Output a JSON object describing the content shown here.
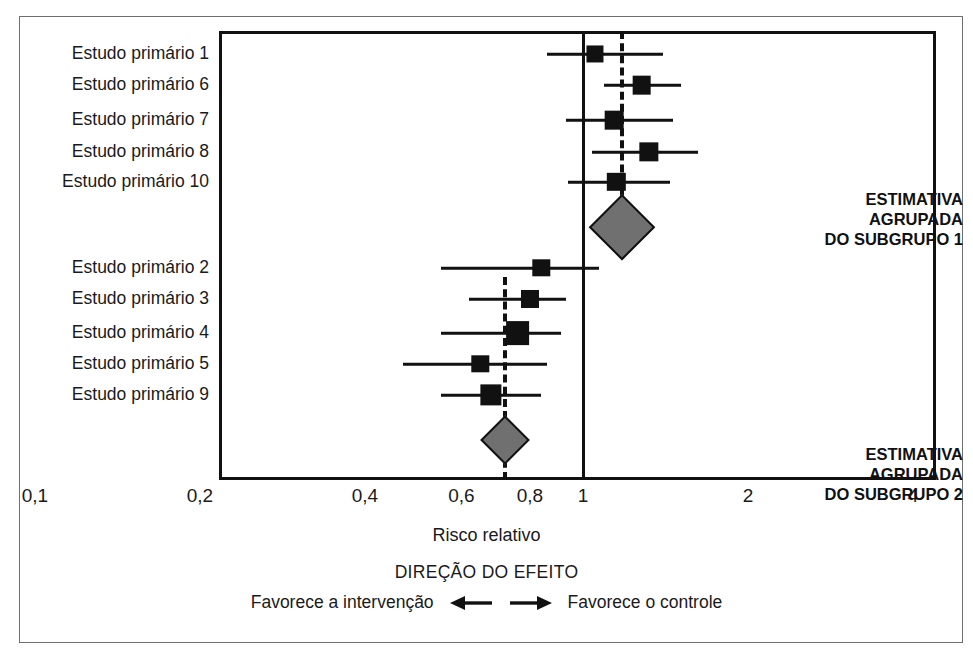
{
  "chart_data": {
    "type": "forest",
    "title": "",
    "xlabel": "Risco relativo",
    "ylabel": "",
    "xscale": "log",
    "xlim": [
      0.085,
      4.6
    ],
    "grid": false,
    "legend": "none",
    "null_line": 1,
    "tick_labels": [
      "0,1",
      "0,2",
      "0,4",
      "0,6",
      "0,8",
      "1",
      "2",
      "4"
    ],
    "tick_values": [
      0.1,
      0.2,
      0.4,
      0.6,
      0.8,
      1,
      2,
      4
    ],
    "subgroups": [
      {
        "name": "ESTIMATIVA AGRUPADA DO SUBGRUPO 1",
        "pooled_label_lines": [
          "ESTIMATIVA",
          "AGRUPADA",
          "DO SUBGRUPO 1"
        ],
        "pooled_estimate": 1.18,
        "pooled_ci_low": 1.03,
        "pooled_ci_high": 1.36,
        "dashed_reference": 1.18,
        "studies": [
          {
            "label": "Estudo primário 1",
            "estimate": 1.05,
            "ci_low": 0.86,
            "ci_high": 1.4,
            "weight": 0.38
          },
          {
            "label": "Estudo primário 6",
            "estimate": 1.28,
            "ci_low": 1.09,
            "ci_high": 1.51,
            "weight": 0.48
          },
          {
            "label": "Estudo primário 7",
            "estimate": 1.14,
            "ci_low": 0.93,
            "ci_high": 1.46,
            "weight": 0.48
          },
          {
            "label": "Estudo primário 8",
            "estimate": 1.32,
            "ci_low": 1.04,
            "ci_high": 1.62,
            "weight": 0.52
          },
          {
            "label": "Estudo primário 10",
            "estimate": 1.15,
            "ci_low": 0.94,
            "ci_high": 1.44,
            "weight": 0.46
          }
        ]
      },
      {
        "name": "ESTIMATIVA AGRUPADA DO SUBGRUPO 2",
        "pooled_label_lines": [
          "ESTIMATIVA",
          "AGRUPADA",
          "DO SUBGRUPO 2"
        ],
        "pooled_estimate": 0.72,
        "pooled_ci_low": 0.65,
        "pooled_ci_high": 0.8,
        "dashed_reference": 0.72,
        "studies": [
          {
            "label": "Estudo primário 2",
            "estimate": 0.84,
            "ci_low": 0.55,
            "ci_high": 1.07,
            "weight": 0.4
          },
          {
            "label": "Estudo primário 3",
            "estimate": 0.8,
            "ci_low": 0.62,
            "ci_high": 0.93,
            "weight": 0.44
          },
          {
            "label": "Estudo primário 4",
            "estimate": 0.76,
            "ci_low": 0.55,
            "ci_high": 0.91,
            "weight": 0.8
          },
          {
            "label": "Estudo primário 5",
            "estimate": 0.65,
            "ci_low": 0.47,
            "ci_high": 0.86,
            "weight": 0.4
          },
          {
            "label": "Estudo primário 9",
            "estimate": 0.68,
            "ci_low": 0.55,
            "ci_high": 0.84,
            "weight": 0.64
          }
        ]
      }
    ],
    "annotations": {
      "direction_title": "DIREÇÃO DO EFEITO",
      "favors_left": "Favorece a intervenção",
      "favors_right": "Favorece o controle"
    }
  },
  "axis": {
    "x_label": "Risco relativo",
    "ticks": [
      "0,1",
      "0,2",
      "0,4",
      "0,6",
      "0,8",
      "1",
      "2",
      "4"
    ]
  },
  "footer": {
    "direction_title": "DIREÇÃO DO EFEITO",
    "favors_intervention": "Favorece a intervenção",
    "favors_control": "Favorece o controle",
    "left_arrow": "left-arrow-icon",
    "right_arrow": "right-arrow-icon"
  },
  "colors": {
    "diamond_fill": "#707070",
    "ink": "#111111",
    "frame": "#6f6f6f"
  }
}
